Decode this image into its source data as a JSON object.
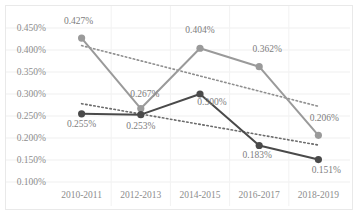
{
  "chart_data": {
    "type": "line",
    "title": "",
    "subtitle": "",
    "xlabel": "",
    "ylabel": "",
    "categories": [
      "2010-2011",
      "2012-2013",
      "2014-2015",
      "2016-2017",
      "2018-2019"
    ],
    "ylim": [
      0.1,
      0.45
    ],
    "ytick_labels": [
      "0.450%",
      "0.400%",
      "0.350%",
      "0.300%",
      "0.250%",
      "0.200%",
      "0.150%",
      "0.100%"
    ],
    "ytick_values": [
      0.45,
      0.4,
      0.35,
      0.3,
      0.25,
      0.2,
      0.15,
      0.1
    ],
    "grid": true,
    "legend": "none",
    "series": [
      {
        "name": "series-light",
        "color": "#9a9a9a",
        "marker": "circle",
        "values": [
          0.427,
          0.267,
          0.404,
          0.362,
          0.206
        ],
        "labels": [
          "0.427%",
          "0.267%",
          "0.404%",
          "0.362%",
          "0.206%"
        ]
      },
      {
        "name": "series-dark",
        "color": "#4a4a4a",
        "marker": "circle",
        "values": [
          0.255,
          0.253,
          0.3,
          0.183,
          0.151
        ],
        "labels": [
          "0.255%",
          "0.253%",
          "0.300%",
          "0.183%",
          "0.151%"
        ]
      }
    ],
    "trendlines": [
      {
        "name": "trendline-light",
        "style": "dotted",
        "color": "#8f8f8f",
        "start_value": 0.41,
        "end_value": 0.272
      },
      {
        "name": "trendline-dark",
        "style": "dotted",
        "color": "#6b6b6b",
        "start_value": 0.278,
        "end_value": 0.184
      }
    ]
  }
}
